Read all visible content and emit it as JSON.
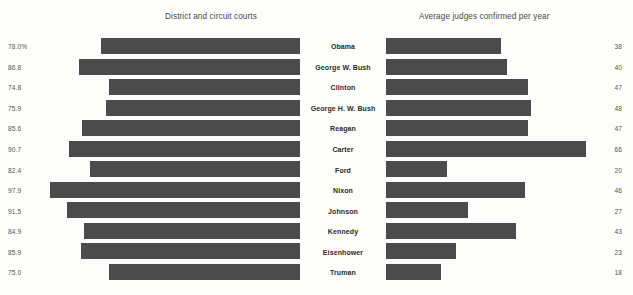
{
  "chart_data": {
    "type": "bar",
    "title": "",
    "subtitle": "",
    "orientation": "horizontal",
    "layout": "bidirectional-paired-panels",
    "grid": false,
    "legend": null,
    "categories": [
      "Obama",
      "George W. Bush",
      "Clinton",
      "George H. W. Bush",
      "Reagan",
      "Carter",
      "Ford",
      "Nixon",
      "Johnson",
      "Kennedy",
      "Eisenhower",
      "Truman"
    ],
    "panels": [
      {
        "name": "left",
        "title": "District and circuit courts",
        "label_suffix": "%",
        "label_side": "left",
        "bar_align": "right",
        "values": [
          78.0,
          86.8,
          74.8,
          75.9,
          85.6,
          90.7,
          82.4,
          97.9,
          91.5,
          84.9,
          85.9,
          75.0
        ],
        "value_labels": [
          "78.0%",
          "86.8",
          "74.8",
          "75.9",
          "85.6",
          "90.7",
          "82.4",
          "97.9",
          "91.5",
          "84.9",
          "85.9",
          "75.0"
        ],
        "axis_min": 0,
        "axis_max": 100
      },
      {
        "name": "right",
        "title": "Average judges confirmed per year",
        "label_suffix": "",
        "label_side": "right",
        "bar_align": "left",
        "values": [
          38,
          40,
          47,
          48,
          47,
          66,
          20,
          46,
          27,
          43,
          23,
          18
        ],
        "value_labels": [
          "38",
          "40",
          "47",
          "48",
          "47",
          "66",
          "20",
          "46",
          "27",
          "43",
          "23",
          "18"
        ],
        "axis_min": 0,
        "axis_max": 70
      }
    ],
    "series": [
      {
        "name": "District and circuit courts",
        "values": [
          78.0,
          86.8,
          74.8,
          75.9,
          85.6,
          90.7,
          82.4,
          97.9,
          91.5,
          84.9,
          85.9,
          75.0
        ]
      },
      {
        "name": "Average judges confirmed per year",
        "values": [
          38,
          40,
          47,
          48,
          47,
          66,
          20,
          46,
          27,
          43,
          23,
          18
        ]
      }
    ],
    "xlabel": "",
    "ylabel": "",
    "colors": {
      "bar": "#4b4b4b",
      "background": "#fdfdfc",
      "value_text": "#555555",
      "category_text": "#2b2b2b",
      "header_text": "#4a4a4a"
    }
  },
  "headers": {
    "left": "District and circuit courts",
    "right": "Average judges confirmed per year"
  },
  "rows": [
    {
      "value_left": "78.0%",
      "name": "Obama",
      "value_right": "38"
    },
    {
      "value_left": "86.8",
      "name": "George W. Bush",
      "value_right": "40"
    },
    {
      "value_left": "74.8",
      "name": "Clinton",
      "value_right": "47"
    },
    {
      "value_left": "75.9",
      "name": "George H. W. Bush",
      "value_right": "48"
    },
    {
      "value_left": "85.6",
      "name": "Reagan",
      "value_right": "47"
    },
    {
      "value_left": "90.7",
      "name": "Carter",
      "value_right": "66"
    },
    {
      "value_left": "82.4",
      "name": "Ford",
      "value_right": "20"
    },
    {
      "value_left": "97.9",
      "name": "Nixon",
      "value_right": "46"
    },
    {
      "value_left": "91.5",
      "name": "Johnson",
      "value_right": "27"
    },
    {
      "value_left": "84.9",
      "name": "Kennedy",
      "value_right": "43"
    },
    {
      "value_left": "85.9",
      "name": "Eisenhower",
      "value_right": "23"
    },
    {
      "value_left": "75.0",
      "name": "Truman",
      "value_right": "18"
    }
  ]
}
